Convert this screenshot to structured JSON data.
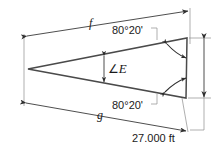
{
  "diagram": {
    "type": "geometry-triangle-dimensioned",
    "background_color": "#ffffff",
    "line_color": "#3a3a3a",
    "text_color": "#1a1a1a",
    "labels": {
      "side_f": "f",
      "side_g": "g",
      "angle_top": "80°20'",
      "angle_bottom": "80°20'",
      "apex_angle_symbol": "∠",
      "apex_angle_name": "E",
      "base_dimension": "27.000 ft"
    },
    "geometry": {
      "apex": [
        28,
        69
      ],
      "top_right": [
        187,
        38
      ],
      "bottom_right": [
        186,
        98
      ],
      "base_length_value": 27.0,
      "base_length_units": "ft",
      "base_angles_deg": 80,
      "base_angles_min": 20
    },
    "annotations": [
      {
        "name": "dimension-f",
        "label": "f",
        "from": "apex",
        "to": "top_right"
      },
      {
        "name": "dimension-g",
        "label": "g",
        "from": "apex",
        "to": "bottom_right"
      },
      {
        "name": "dimension-base",
        "label": "27.000 ft",
        "from": "top_right",
        "to": "bottom_right"
      },
      {
        "name": "angle-top-leader",
        "label": "80°20'"
      },
      {
        "name": "angle-bottom-leader",
        "label": "80°20'"
      },
      {
        "name": "apex-angle",
        "label": "∠E"
      }
    ]
  }
}
